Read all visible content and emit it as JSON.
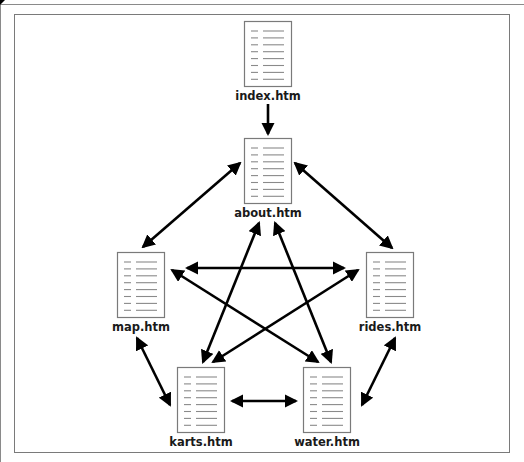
{
  "diagram": {
    "title": "",
    "node_icon": "html-document-icon",
    "colors": {
      "edge": "#000000",
      "doc_border": "#7a7a7a",
      "doc_lines": "#8a8a8a",
      "label": "#1a1a1a",
      "frame": "#7a7a7a"
    },
    "nodes": [
      {
        "id": "index",
        "label": "index.htm",
        "x": 244,
        "y": 21
      },
      {
        "id": "about",
        "label": "about.htm",
        "x": 244,
        "y": 138
      },
      {
        "id": "map",
        "label": "map.htm",
        "x": 117,
        "y": 252
      },
      {
        "id": "rides",
        "label": "rides.htm",
        "x": 366,
        "y": 252
      },
      {
        "id": "karts",
        "label": "karts.htm",
        "x": 177,
        "y": 367
      },
      {
        "id": "water",
        "label": "water.htm",
        "x": 303,
        "y": 367
      }
    ],
    "edges": [
      {
        "from": "index",
        "to": "about",
        "direction": "one-way",
        "x1": 268,
        "y1": 104,
        "x2": 268,
        "y2": 134
      },
      {
        "from": "about",
        "to": "map",
        "direction": "two-way",
        "x1": 240,
        "y1": 163,
        "x2": 143,
        "y2": 247
      },
      {
        "from": "about",
        "to": "rides",
        "direction": "two-way",
        "x1": 295,
        "y1": 163,
        "x2": 392,
        "y2": 248
      },
      {
        "from": "map",
        "to": "rides",
        "direction": "two-way",
        "x1": 187,
        "y1": 268,
        "x2": 344,
        "y2": 268
      },
      {
        "from": "about",
        "to": "karts",
        "direction": "two-way",
        "x1": 259,
        "y1": 223,
        "x2": 203,
        "y2": 362
      },
      {
        "from": "about",
        "to": "water",
        "direction": "two-way",
        "x1": 275,
        "y1": 223,
        "x2": 331,
        "y2": 362
      },
      {
        "from": "map",
        "to": "water",
        "direction": "two-way",
        "x1": 172,
        "y1": 270,
        "x2": 318,
        "y2": 362
      },
      {
        "from": "rides",
        "to": "karts",
        "direction": "two-way",
        "x1": 358,
        "y1": 270,
        "x2": 213,
        "y2": 362
      },
      {
        "from": "map",
        "to": "karts",
        "direction": "two-way",
        "x1": 137,
        "y1": 338,
        "x2": 170,
        "y2": 405
      },
      {
        "from": "rides",
        "to": "water",
        "direction": "two-way",
        "x1": 395,
        "y1": 338,
        "x2": 362,
        "y2": 405
      },
      {
        "from": "karts",
        "to": "water",
        "direction": "two-way",
        "x1": 232,
        "y1": 401,
        "x2": 296,
        "y2": 401
      }
    ]
  }
}
